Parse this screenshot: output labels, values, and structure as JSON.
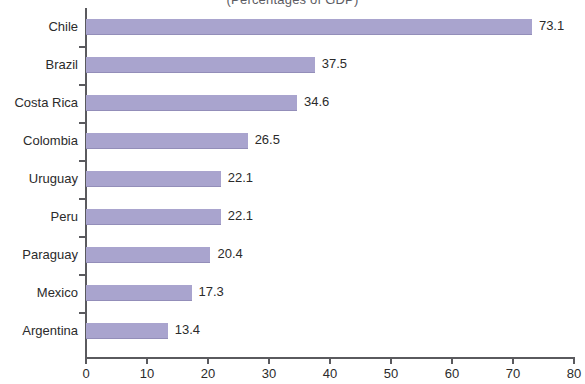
{
  "chart_data": {
    "type": "bar",
    "orientation": "horizontal",
    "title": "",
    "subtitle": "(Percentages of GDP)",
    "categories": [
      "Chile",
      "Brazil",
      "Costa Rica",
      "Colombia",
      "Uruguay",
      "Peru",
      "Paraguay",
      "Mexico",
      "Argentina"
    ],
    "values": [
      73.1,
      37.5,
      34.6,
      26.5,
      22.1,
      22.1,
      20.4,
      17.3,
      13.4
    ],
    "value_labels": [
      "73.1",
      "37.5",
      "34.6",
      "26.5",
      "22.1",
      "22.1",
      "20.4",
      "17.3",
      "13.4"
    ],
    "xlabel": "",
    "ylabel": "",
    "xlim": [
      0,
      80
    ],
    "xticks": [
      0,
      10,
      20,
      30,
      40,
      50,
      60,
      70,
      80
    ],
    "xtick_labels": [
      "0",
      "10",
      "20",
      "30",
      "40",
      "50",
      "60",
      "70",
      "80"
    ],
    "grid": false,
    "legend": null,
    "bar_color": "#a9a4ce",
    "axis_color": "#5a5a5e",
    "text_color": "#2b2b2b",
    "background": "#ffffff"
  }
}
